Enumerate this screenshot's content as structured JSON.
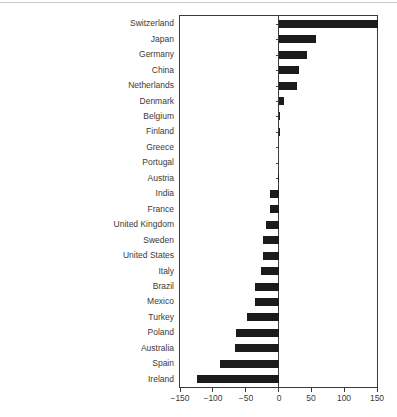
{
  "figure": {
    "top_rule_color": "#c9c9c9",
    "background_color": "#ffffff"
  },
  "chart_data": {
    "type": "bar",
    "orientation": "horizontal",
    "title": "",
    "xlabel": "",
    "ylabel": "",
    "grid": false,
    "legend": "none",
    "bar_color": "#1b1b1b",
    "axis_color": "#3c3c3c",
    "text_color": "#3a3a3a",
    "xlim": [
      -150,
      150
    ],
    "x_tick_values": [
      -150,
      -100,
      -50,
      0,
      50,
      100,
      150
    ],
    "x_tick_labels": [
      "−150",
      "−100",
      "−50",
      "0",
      "50",
      "100",
      "150"
    ],
    "categories": [
      "Switzerland",
      "Japan",
      "Germany",
      "China",
      "Netherlands",
      "Denmark",
      "Belgium",
      "Finland",
      "Greece",
      "Portugal",
      "Austria",
      "India",
      "France",
      "United Kingdom",
      "Sweden",
      "United States",
      "Italy",
      "Brazil",
      "Mexico",
      "Turkey",
      "Poland",
      "Australia",
      "Spain",
      "Ireland"
    ],
    "values": [
      150,
      56,
      42,
      30,
      27,
      7,
      2,
      1,
      0,
      0,
      -1,
      -13,
      -14,
      -20,
      -24,
      -24,
      -28,
      -36,
      -37,
      -49,
      -65,
      -67,
      -90,
      -125
    ]
  }
}
